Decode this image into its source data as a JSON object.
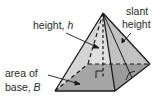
{
  "diagram": {
    "labels": {
      "height": {
        "text": "height, ",
        "var": "h"
      },
      "slant": {
        "line1": "slant",
        "line2": "height"
      },
      "base": {
        "line1": "area of",
        "line2_text": "base, ",
        "line2_var": "B"
      }
    },
    "colors": {
      "base_fill": "#7a7a7a",
      "face_left": "#d2d2d2",
      "face_front": "#b8b8b8",
      "face_right": "#a9a9a9",
      "edge": "#1a1a1a",
      "text": "#2a2a2a"
    }
  }
}
